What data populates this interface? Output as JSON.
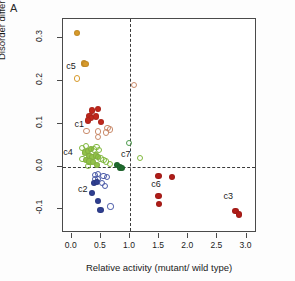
{
  "panel": {
    "label": "A"
  },
  "chart_data": {
    "type": "scatter",
    "title": "",
    "xlabel": "Relative activity (mutant/ wild type)",
    "ylabel": "Disorder difference (mutant – wild type)",
    "xlim": [
      -0.15,
      3.18
    ],
    "ylim": [
      -0.155,
      0.345
    ],
    "xticks": [
      0.0,
      0.5,
      1.0,
      1.5,
      2.0,
      2.5,
      3.0
    ],
    "xticklabels": [
      "0.0",
      "0.5",
      "1.0",
      "1.5",
      "2.0",
      "2.5",
      "3.0"
    ],
    "yticks": [
      -0.1,
      0.0,
      0.1,
      0.2,
      0.3
    ],
    "yticklabels": [
      "-0.1",
      "0.0",
      "0.1",
      "0.2",
      "0.3"
    ],
    "grid": false,
    "legend_position": "none",
    "reference_lines": [
      {
        "axis": "y",
        "value": 0.0,
        "style": "dashed",
        "color": "#3b3b3b"
      },
      {
        "axis": "x",
        "value": 1.0,
        "style": "dashed",
        "color": "#3b3b3b"
      }
    ],
    "cluster_labels": [
      {
        "text": "c5",
        "x": 0.06,
        "y": 0.233
      },
      {
        "text": "c1",
        "x": 0.2,
        "y": 0.098
      },
      {
        "text": "c4",
        "x": 0.01,
        "y": 0.031
      },
      {
        "text": "c2",
        "x": 0.26,
        "y": -0.055
      },
      {
        "text": "c7",
        "x": 1.0,
        "y": 0.027
      },
      {
        "text": "c6",
        "x": 1.52,
        "y": -0.042
      },
      {
        "text": "c3",
        "x": 2.76,
        "y": -0.072
      }
    ],
    "series": [
      {
        "name": "c5",
        "color": "#d79a2b",
        "open_color": "#d79a2b",
        "points": [
          {
            "x": 0.09,
            "y": 0.312,
            "filled": true
          },
          {
            "x": 0.21,
            "y": 0.241,
            "filled": true
          },
          {
            "x": 0.235,
            "y": 0.239,
            "filled": true
          },
          {
            "x": 0.095,
            "y": 0.206,
            "filled": false
          }
        ]
      },
      {
        "name": "c1",
        "color": "#c0271c",
        "open_color": "#c98a6a",
        "points": [
          {
            "x": 0.345,
            "y": 0.131,
            "filled": true
          },
          {
            "x": 0.445,
            "y": 0.134,
            "filled": true
          },
          {
            "x": 0.305,
            "y": 0.119,
            "filled": true
          },
          {
            "x": 0.325,
            "y": 0.113,
            "filled": true
          },
          {
            "x": 0.41,
            "y": 0.117,
            "filled": true
          },
          {
            "x": 0.285,
            "y": 0.108,
            "filled": true
          },
          {
            "x": 0.5,
            "y": 0.105,
            "filled": true
          },
          {
            "x": 0.255,
            "y": 0.083,
            "filled": false
          },
          {
            "x": 0.445,
            "y": 0.082,
            "filled": false
          },
          {
            "x": 0.445,
            "y": 0.069,
            "filled": false
          },
          {
            "x": 0.615,
            "y": 0.09,
            "filled": false
          },
          {
            "x": 0.655,
            "y": 0.087,
            "filled": false
          },
          {
            "x": 0.585,
            "y": 0.08,
            "filled": false
          },
          {
            "x": 1.07,
            "y": 0.191,
            "filled": false
          }
        ]
      },
      {
        "name": "c4",
        "color": "#92c249",
        "open_color": "#7fb83c",
        "points": [
          {
            "x": 0.175,
            "y": 0.044,
            "filled": false
          },
          {
            "x": 0.245,
            "y": 0.049,
            "filled": false
          },
          {
            "x": 0.225,
            "y": 0.033,
            "filled": true
          },
          {
            "x": 0.285,
            "y": 0.036,
            "filled": true
          },
          {
            "x": 0.325,
            "y": 0.042,
            "filled": true
          },
          {
            "x": 0.385,
            "y": 0.04,
            "filled": false
          },
          {
            "x": 0.425,
            "y": 0.046,
            "filled": false
          },
          {
            "x": 0.475,
            "y": 0.039,
            "filled": false
          },
          {
            "x": 0.305,
            "y": 0.024,
            "filled": true
          },
          {
            "x": 0.355,
            "y": 0.022,
            "filled": true
          },
          {
            "x": 0.415,
            "y": 0.026,
            "filled": true
          },
          {
            "x": 0.455,
            "y": 0.023,
            "filled": true
          },
          {
            "x": 0.185,
            "y": 0.018,
            "filled": false
          },
          {
            "x": 0.245,
            "y": 0.015,
            "filled": true
          },
          {
            "x": 0.305,
            "y": 0.012,
            "filled": true
          },
          {
            "x": 0.365,
            "y": 0.01,
            "filled": true
          },
          {
            "x": 0.495,
            "y": 0.019,
            "filled": false
          },
          {
            "x": 0.545,
            "y": 0.016,
            "filled": false
          },
          {
            "x": 0.595,
            "y": 0.012,
            "filled": false
          },
          {
            "x": 0.655,
            "y": 0.006,
            "filled": false
          },
          {
            "x": 0.435,
            "y": 0.004,
            "filled": true
          },
          {
            "x": 0.285,
            "y": 0.001,
            "filled": false
          },
          {
            "x": 1.17,
            "y": 0.02,
            "filled": false
          }
        ]
      },
      {
        "name": "c7",
        "color": "#1f6b2e",
        "open_color": "#4f9b4f",
        "points": [
          {
            "x": 0.775,
            "y": 0.003,
            "filled": true
          },
          {
            "x": 0.835,
            "y": -0.002,
            "filled": true
          },
          {
            "x": 0.865,
            "y": -0.004,
            "filled": true
          },
          {
            "x": 0.985,
            "y": 0.056,
            "filled": false
          }
        ]
      },
      {
        "name": "c2",
        "color": "#2f3f91",
        "open_color": "#4a5aa8",
        "points": [
          {
            "x": 0.405,
            "y": -0.019,
            "filled": false
          },
          {
            "x": 0.455,
            "y": -0.017,
            "filled": false
          },
          {
            "x": 0.405,
            "y": -0.029,
            "filled": false
          },
          {
            "x": 0.455,
            "y": -0.028,
            "filled": false
          },
          {
            "x": 0.545,
            "y": -0.022,
            "filled": false
          },
          {
            "x": 0.605,
            "y": -0.024,
            "filled": false
          },
          {
            "x": 0.385,
            "y": -0.039,
            "filled": true
          },
          {
            "x": 0.435,
            "y": -0.036,
            "filled": true
          },
          {
            "x": 0.525,
            "y": -0.038,
            "filled": false
          },
          {
            "x": 0.565,
            "y": -0.045,
            "filled": false
          },
          {
            "x": 0.345,
            "y": -0.062,
            "filled": true
          },
          {
            "x": 0.455,
            "y": -0.08,
            "filled": true
          },
          {
            "x": 0.495,
            "y": -0.102,
            "filled": true
          },
          {
            "x": 0.665,
            "y": -0.093,
            "filled": false
          }
        ]
      },
      {
        "name": "c6",
        "color": "#b01c18",
        "open_color": "#b01c18",
        "points": [
          {
            "x": 1.49,
            "y": -0.022,
            "filled": true
          },
          {
            "x": 1.72,
            "y": -0.024,
            "filled": true
          },
          {
            "x": 1.49,
            "y": -0.069,
            "filled": true
          },
          {
            "x": 1.5,
            "y": -0.087,
            "filled": true
          }
        ]
      },
      {
        "name": "c3",
        "color": "#b01c18",
        "open_color": "#b01c18",
        "points": [
          {
            "x": 2.81,
            "y": -0.104,
            "filled": true
          },
          {
            "x": 2.87,
            "y": -0.112,
            "filled": true
          }
        ]
      }
    ]
  }
}
